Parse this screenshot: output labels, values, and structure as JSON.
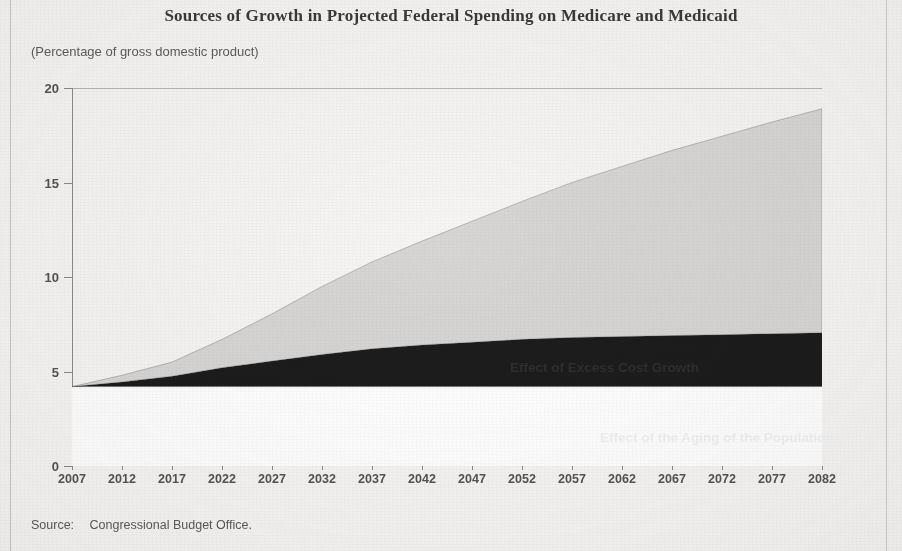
{
  "figure": {
    "title": "Sources of Growth in Projected Federal Spending on Medicare and Medicaid",
    "subtitle": "(Percentage of gross domestic product)",
    "source_label": "Source:",
    "source_text": "Congressional Budget Office."
  },
  "colors": {
    "page_background": "#f6f5f3",
    "excess_cost_growth_fill": "#d7d6d4",
    "aging_fill": "#1c1c1c",
    "baseline_fill": "#ffffff",
    "axis": "#8e8c8a",
    "title_text": "#3a3a3a"
  },
  "chart_data": {
    "type": "area",
    "title": "Sources of Growth in Projected Federal Spending on Medicare and Medicaid",
    "subtitle": "(Percentage of gross domestic product)",
    "xlabel": "",
    "ylabel": "Percentage of gross domestic product",
    "xlim": [
      2007,
      2082
    ],
    "ylim": [
      0,
      20
    ],
    "ytick_labels": [
      "0",
      "5",
      "10",
      "15",
      "20"
    ],
    "yticks": [
      0,
      5,
      10,
      15,
      20
    ],
    "xtick_labels": [
      "2007",
      "2012",
      "2017",
      "2022",
      "2027",
      "2032",
      "2037",
      "2042",
      "2047",
      "2052",
      "2057",
      "2062",
      "2067",
      "2072",
      "2077",
      "2082"
    ],
    "xticks": [
      2007,
      2012,
      2017,
      2022,
      2027,
      2032,
      2037,
      2042,
      2047,
      2052,
      2057,
      2062,
      2067,
      2072,
      2077,
      2082
    ],
    "grid": false,
    "legend_position": "inline-annotation",
    "stacked": true,
    "x": [
      2007,
      2012,
      2017,
      2022,
      2027,
      2032,
      2037,
      2042,
      2047,
      2052,
      2057,
      2062,
      2067,
      2072,
      2077,
      2082
    ],
    "series": [
      {
        "name": "Baseline spending (2007 level)",
        "label_shown": false,
        "fill": "#ffffff",
        "values": [
          4.2,
          4.2,
          4.2,
          4.2,
          4.2,
          4.2,
          4.2,
          4.2,
          4.2,
          4.2,
          4.2,
          4.2,
          4.2,
          4.2,
          4.2,
          4.2
        ]
      },
      {
        "name": "Effect of the Aging of the Population",
        "label_shown": true,
        "fill": "#1c1c1c",
        "values": [
          0.0,
          0.25,
          0.55,
          1.0,
          1.35,
          1.7,
          2.0,
          2.2,
          2.35,
          2.5,
          2.6,
          2.65,
          2.7,
          2.75,
          2.8,
          2.85
        ]
      },
      {
        "name": "Effect of Excess Cost Growth",
        "label_shown": true,
        "fill": "#d7d6d4",
        "values": [
          0.0,
          0.35,
          0.75,
          1.5,
          2.5,
          3.6,
          4.6,
          5.5,
          6.4,
          7.3,
          8.2,
          9.0,
          9.8,
          10.5,
          11.2,
          11.85
        ]
      }
    ],
    "cumulative_top": [
      4.2,
      4.8,
      5.5,
      6.7,
      8.05,
      9.5,
      10.8,
      11.9,
      12.95,
      14.0,
      15.0,
      15.85,
      16.7,
      17.45,
      18.2,
      18.9
    ],
    "annotations": [
      {
        "text": "Effect of Excess Cost Growth",
        "x": 2046,
        "y": 10.2,
        "color": "#2e2e2e"
      },
      {
        "text": "Effect of the Aging of the Population",
        "x": 2056,
        "y": 6.0,
        "color": "#f2f2f2"
      }
    ]
  }
}
